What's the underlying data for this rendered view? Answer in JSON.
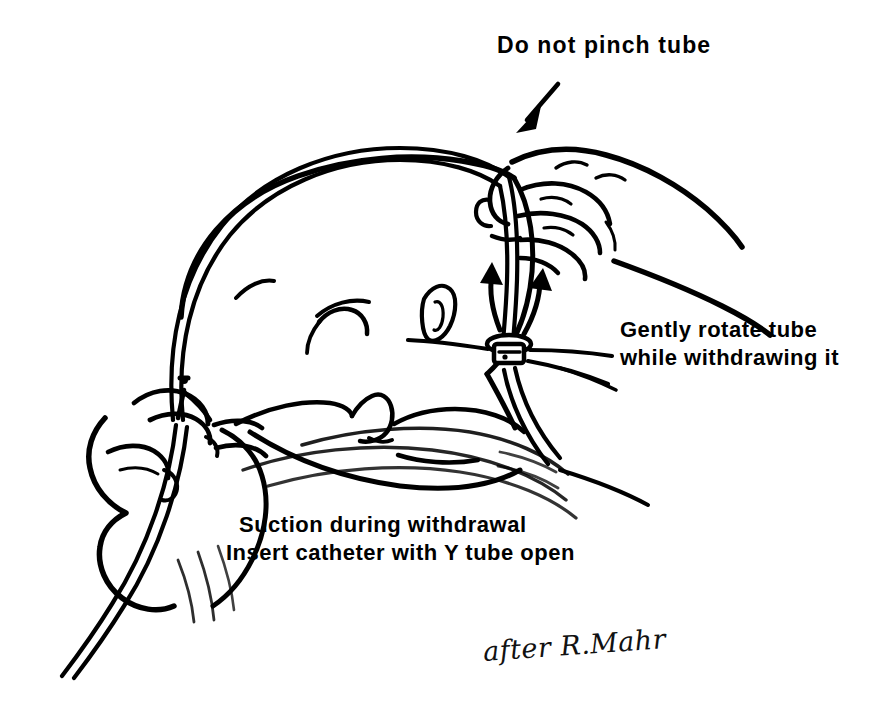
{
  "figure": {
    "background_color": "#ffffff",
    "ink_color": "#000000",
    "width": 890,
    "height": 727
  },
  "annotations": {
    "do_not_pinch": "Do not pinch tube",
    "gently_rotate_line1": "Gently rotate tube",
    "gently_rotate_line2": "while withdrawing it",
    "suction_line1": "Suction during withdrawal",
    "suction_line2": "Insert catheter with Y tube open"
  },
  "attribution": "after R.Mahr"
}
